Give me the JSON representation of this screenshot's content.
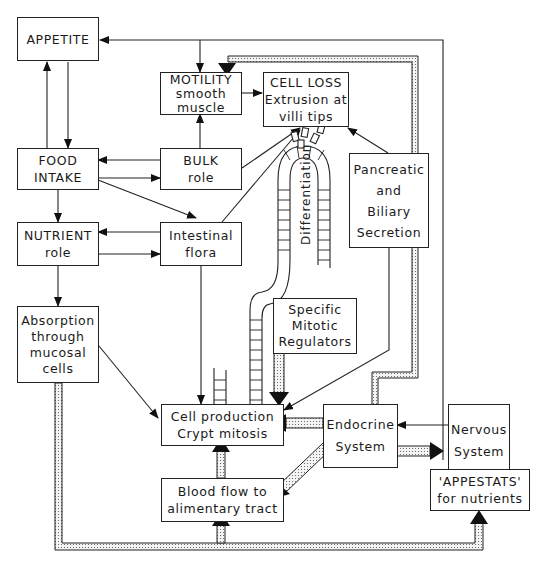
{
  "diagram": {
    "boxes": {
      "appetite": {
        "lines": [
          "APPETITE"
        ]
      },
      "motility": {
        "lines": [
          "MOTILITY",
          "smooth",
          "muscle"
        ]
      },
      "cell_loss": {
        "lines": [
          "CELL LOSS",
          "Extrusion at",
          "villi tips"
        ]
      },
      "food_intake": {
        "lines": [
          "FOOD",
          "INTAKE"
        ]
      },
      "bulk": {
        "lines": [
          "BULK",
          "role"
        ]
      },
      "pancreatic": {
        "lines": [
          "Pancreatic",
          "and",
          "Biliary",
          "Secretion"
        ]
      },
      "nutrient": {
        "lines": [
          "NUTRIENT",
          "role"
        ]
      },
      "flora": {
        "lines": [
          "Intestinal",
          "flora"
        ]
      },
      "absorption": {
        "lines": [
          "Absorption",
          "through",
          "mucosal",
          "cells"
        ]
      },
      "mitotic": {
        "lines": [
          "Specific",
          "Mitotic",
          "Regulators"
        ]
      },
      "cell_production": {
        "lines": [
          "Cell production",
          "Crypt mitosis"
        ]
      },
      "endocrine": {
        "lines": [
          "Endocrine",
          "System"
        ]
      },
      "nervous": {
        "lines": [
          "Nervous",
          "System"
        ]
      },
      "appestats": {
        "lines": [
          "'APPESTATS'",
          "for nutrients"
        ]
      },
      "blood_flow": {
        "lines": [
          "Blood flow to",
          "alimentary tract"
        ]
      }
    },
    "crypt_label": "Differentiation",
    "colors": {
      "line": "#222222",
      "stipple_bg": "#f4f4f4",
      "stipple_dot": "#555555"
    }
  }
}
